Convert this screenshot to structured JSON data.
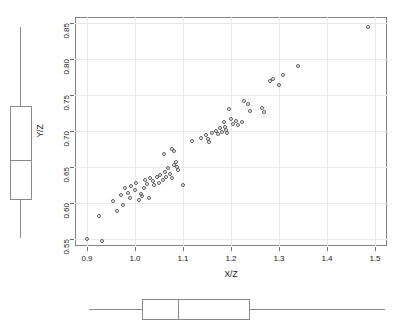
{
  "chart_data": {
    "type": "scatter",
    "title": "",
    "xlabel": "X/Z",
    "ylabel": "Y/Z",
    "xlim": [
      0.875,
      1.525
    ],
    "ylim": [
      0.5395,
      0.8585
    ],
    "xticks": [
      0.9,
      1.0,
      1.1,
      1.2,
      1.3,
      1.4,
      1.5
    ],
    "xticklabels": [
      "0.9",
      "1.0",
      "1.1",
      "1.2",
      "1.3",
      "1.4",
      "1.5"
    ],
    "yticks": [
      0.55,
      0.6,
      0.65,
      0.7,
      0.75,
      0.8,
      0.85
    ],
    "yticklabels": [
      "0.55",
      "0.60",
      "0.65",
      "0.70",
      "0.75",
      "0.80",
      "0.85"
    ],
    "grid": true,
    "grid_color": "#e9e9e9",
    "legend": null,
    "marker": "open-circle",
    "marker_color": "#5a5a5a",
    "n_points": 71,
    "points": [
      [
        0.9,
        0.55
      ],
      [
        0.932,
        0.546
      ],
      [
        0.925,
        0.582
      ],
      [
        0.955,
        0.602
      ],
      [
        0.963,
        0.588
      ],
      [
        0.975,
        0.597
      ],
      [
        0.97,
        0.61
      ],
      [
        0.98,
        0.62
      ],
      [
        0.985,
        0.614
      ],
      [
        0.99,
        0.606
      ],
      [
        0.992,
        0.623
      ],
      [
        1.0,
        0.617
      ],
      [
        1.002,
        0.628
      ],
      [
        1.008,
        0.604
      ],
      [
        1.012,
        0.612
      ],
      [
        1.015,
        0.609
      ],
      [
        1.018,
        0.621
      ],
      [
        1.02,
        0.632
      ],
      [
        1.025,
        0.626
      ],
      [
        1.03,
        0.607
      ],
      [
        1.032,
        0.634
      ],
      [
        1.038,
        0.63
      ],
      [
        1.04,
        0.625
      ],
      [
        1.045,
        0.636
      ],
      [
        1.05,
        0.628
      ],
      [
        1.052,
        0.639
      ],
      [
        1.058,
        0.631
      ],
      [
        1.062,
        0.642
      ],
      [
        1.065,
        0.636
      ],
      [
        1.068,
        0.648
      ],
      [
        1.072,
        0.64
      ],
      [
        1.078,
        0.634
      ],
      [
        1.082,
        0.652
      ],
      [
        1.085,
        0.656
      ],
      [
        1.088,
        0.65
      ],
      [
        1.09,
        0.645
      ],
      [
        1.06,
        0.668
      ],
      [
        1.078,
        0.675
      ],
      [
        1.082,
        0.672
      ],
      [
        1.1,
        0.625
      ],
      [
        1.118,
        0.686
      ],
      [
        1.138,
        0.69
      ],
      [
        1.148,
        0.694
      ],
      [
        1.152,
        0.688
      ],
      [
        1.155,
        0.684
      ],
      [
        1.16,
        0.697
      ],
      [
        1.168,
        0.7
      ],
      [
        1.172,
        0.695
      ],
      [
        1.178,
        0.704
      ],
      [
        1.182,
        0.699
      ],
      [
        1.185,
        0.712
      ],
      [
        1.188,
        0.706
      ],
      [
        1.19,
        0.701
      ],
      [
        1.192,
        0.697
      ],
      [
        1.195,
        0.73
      ],
      [
        1.2,
        0.716
      ],
      [
        1.205,
        0.71
      ],
      [
        1.21,
        0.714
      ],
      [
        1.215,
        0.708
      ],
      [
        1.222,
        0.712
      ],
      [
        1.228,
        0.742
      ],
      [
        1.235,
        0.738
      ],
      [
        1.24,
        0.728
      ],
      [
        1.265,
        0.732
      ],
      [
        1.268,
        0.726
      ],
      [
        1.282,
        0.77
      ],
      [
        1.288,
        0.772
      ],
      [
        1.3,
        0.764
      ],
      [
        1.308,
        0.778
      ],
      [
        1.34,
        0.79
      ],
      [
        1.485,
        0.845
      ]
    ]
  },
  "marginal_boxplots": {
    "y_boxplot": {
      "name": "Y/Z",
      "orientation": "vertical",
      "whisker_low": 0.55,
      "q1": 0.604,
      "median": 0.66,
      "q3": 0.735,
      "whisker_high": 0.845,
      "outliers": []
    },
    "x_boxplot": {
      "name": "X/Z",
      "orientation": "horizontal",
      "whisker_low": 0.905,
      "q1": 1.015,
      "median": 1.09,
      "q3": 1.24,
      "whisker_high": 1.52,
      "outliers": []
    }
  },
  "style": {
    "background": "#ffffff",
    "frame_color": "#828282",
    "grid_color": "#e9e9e9",
    "box_color": "#8a8a8a",
    "point_color": "#5a5a5a",
    "text_color": "#1a1a1a"
  }
}
